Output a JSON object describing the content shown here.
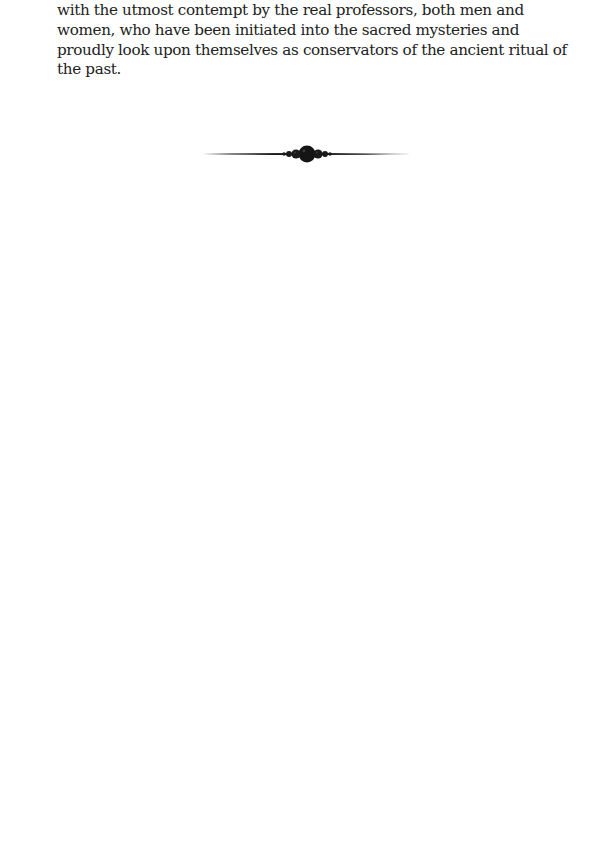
{
  "document": {
    "paragraph_lines": [
      "with the utmost contempt by the real professors, both men and",
      "women, who have been initiated into the sacred mysteries and",
      "proudly look upon themselves as conservators of the ancient ritual of",
      "the past."
    ],
    "ornament": {
      "icon": "section-divider-ornament",
      "color": "#1a1a1a"
    },
    "text_color": "#222222",
    "background_color": "#ffffff"
  }
}
